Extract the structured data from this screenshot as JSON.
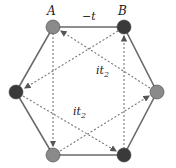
{
  "diagram": {
    "labels": {
      "site_a": "A",
      "site_b": "B",
      "nn_hopping": "−t",
      "nnn_hopping_1": "it",
      "nnn_hopping_1_sub": "2",
      "nnn_hopping_2": "it",
      "nnn_hopping_2_sub": "2"
    },
    "colors": {
      "sublattice_a": "#8a8a8a",
      "sublattice_b": "#3a3a3a",
      "edge": "#6a6a6a",
      "arrow": "#7a7a7a"
    },
    "nodes": [
      {
        "id": "A",
        "x": 53,
        "y": 27,
        "type": "a"
      },
      {
        "id": "B",
        "x": 124,
        "y": 27,
        "type": "b"
      },
      {
        "id": "R",
        "x": 157,
        "y": 92,
        "type": "a"
      },
      {
        "id": "BR",
        "x": 124,
        "y": 155,
        "type": "b"
      },
      {
        "id": "BL",
        "x": 53,
        "y": 155,
        "type": "a"
      },
      {
        "id": "L",
        "x": 16,
        "y": 92,
        "type": "b"
      }
    ],
    "arrows": [
      {
        "from": "A",
        "to": "BL"
      },
      {
        "from": "BL",
        "to": "R"
      },
      {
        "from": "R",
        "to": "A"
      },
      {
        "from": "BR",
        "to": "B"
      },
      {
        "from": "B",
        "to": "L"
      },
      {
        "from": "L",
        "to": "BR"
      }
    ]
  }
}
